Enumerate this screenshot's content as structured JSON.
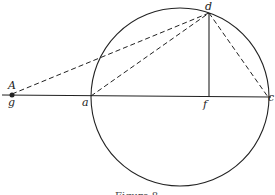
{
  "diagram": {
    "colors": {
      "stroke": "#222222",
      "background": "#ffffff"
    },
    "circle": {
      "cx": 180,
      "cy": 97,
      "r": 89
    },
    "points": {
      "A": {
        "label": "A",
        "x": 12,
        "y": 94
      },
      "g": {
        "label": "g"
      },
      "a": {
        "label": "a",
        "x": 91,
        "y": 96
      },
      "f": {
        "label": "f",
        "x": 209,
        "y": 97
      },
      "c": {
        "label": "c",
        "x": 268,
        "y": 97
      },
      "d": {
        "label": "d",
        "x": 209,
        "y": 13
      }
    },
    "lines": {
      "baseline": "solid line through g, a, f, c",
      "df": "solid vertical line d to f",
      "gd": "dashed line g to d",
      "ad": "dashed line a to d",
      "dc": "dashed line d to c"
    },
    "caption": "Figure 8"
  }
}
